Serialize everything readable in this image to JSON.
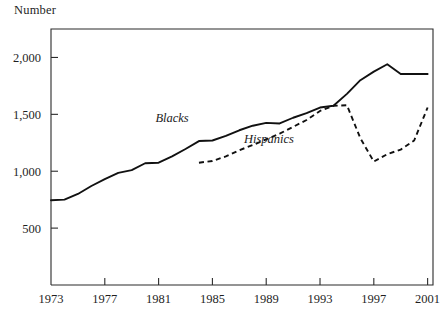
{
  "chart_data": {
    "type": "line",
    "title": "",
    "ylabel": "Number",
    "xlabel": "",
    "xlim": [
      1973,
      2001.4
    ],
    "ylim": [
      0,
      2250
    ],
    "grid": false,
    "legend_position": "inline-annotations",
    "yticks": [
      500,
      1000,
      1500,
      2000
    ],
    "ytick_labels": [
      "500",
      "1,000",
      "1,500",
      "2,000"
    ],
    "xticks": [
      1973,
      1977,
      1981,
      1985,
      1989,
      1993,
      1997,
      2001
    ],
    "xtick_labels": [
      "1973",
      "1977",
      "1981",
      "1985",
      "1989",
      "1993",
      "1997",
      "2001"
    ],
    "x": [
      1973,
      1974,
      1975,
      1976,
      1977,
      1978,
      1979,
      1980,
      1981,
      1982,
      1983,
      1984,
      1985,
      1986,
      1987,
      1988,
      1989,
      1990,
      1991,
      1992,
      1993,
      1994,
      1995,
      1996,
      1997,
      1998,
      1999,
      2000,
      2001
    ],
    "series": [
      {
        "name": "Blacks",
        "style": "solid",
        "color": "#111111",
        "x": [
          1973,
          1974,
          1975,
          1976,
          1977,
          1978,
          1979,
          1980,
          1981,
          1982,
          1983,
          1984,
          1985,
          1986,
          1987,
          1988,
          1989,
          1990,
          1991,
          1992,
          1993,
          1994,
          1995,
          1996,
          1997,
          1998,
          1999,
          2000,
          2001
        ],
        "values": [
          745,
          750,
          800,
          870,
          930,
          985,
          1010,
          1070,
          1075,
          1130,
          1195,
          1265,
          1270,
          1310,
          1360,
          1400,
          1425,
          1420,
          1470,
          1510,
          1560,
          1575,
          1680,
          1800,
          1875,
          1940,
          1855,
          1855,
          1855
        ],
        "label_text": "Blacks",
        "label_x": 1982.0,
        "label_y": 1430
      },
      {
        "name": "Hispanics",
        "style": "dashed",
        "color": "#111111",
        "x": [
          1984,
          1985,
          1986,
          1987,
          1988,
          1989,
          1990,
          1991,
          1992,
          1993,
          1994,
          1995,
          1996,
          1997,
          1998,
          1999,
          2000,
          2001
        ],
        "values": [
          1075,
          1090,
          1130,
          1185,
          1230,
          1280,
          1330,
          1390,
          1450,
          1530,
          1575,
          1580,
          1290,
          1085,
          1150,
          1190,
          1270,
          1560
        ],
        "label_text": "Hispanics",
        "label_x": 1989.2,
        "label_y": 1250
      }
    ]
  },
  "axis": {
    "ylabel": "Number"
  }
}
